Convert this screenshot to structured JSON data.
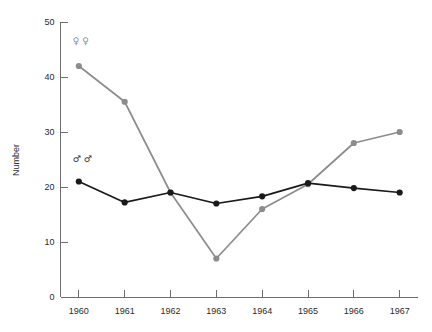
{
  "chart_data": {
    "type": "line",
    "title": "",
    "xlabel": "",
    "ylabel": "Number",
    "x": [
      1960,
      1961,
      1962,
      1963,
      1964,
      1965,
      1966,
      1967
    ],
    "categories": [
      "1960",
      "1961",
      "1962",
      "1963",
      "1964",
      "1965",
      "1966",
      "1967"
    ],
    "xlim": [
      1959.6,
      1967.4
    ],
    "ylim": [
      0,
      50
    ],
    "yticks": [
      0,
      10,
      20,
      30,
      40,
      50
    ],
    "yticklabels": [
      "0",
      "10",
      "20",
      "30",
      "40",
      "50"
    ],
    "xticklabels": [
      "1960",
      "1961",
      "1962",
      "1963",
      "1964",
      "1965",
      "1966",
      "1967"
    ],
    "grid": false,
    "legend": "inline-symbols",
    "series": [
      {
        "name": "Females",
        "symbol": "♀ ♀",
        "color": "#8c8c8c",
        "marker": "circle",
        "label_x": 1960,
        "label_y": 46,
        "values": [
          42,
          35.5,
          19,
          7,
          16,
          20.5,
          28,
          30
        ]
      },
      {
        "name": "Males",
        "symbol": "♂ ♂",
        "color": "#1a1a1a",
        "marker": "circle",
        "label_x": 1960,
        "label_y": 24.5,
        "values": [
          21,
          17.2,
          19,
          17,
          18.3,
          20.7,
          19.8,
          19
        ]
      }
    ]
  },
  "colors": {
    "female_series": "#8c8c8c",
    "male_series": "#1a1a1a",
    "axis": "#6e6e6e",
    "text": "#2b2b2b",
    "background": "#ffffff"
  }
}
